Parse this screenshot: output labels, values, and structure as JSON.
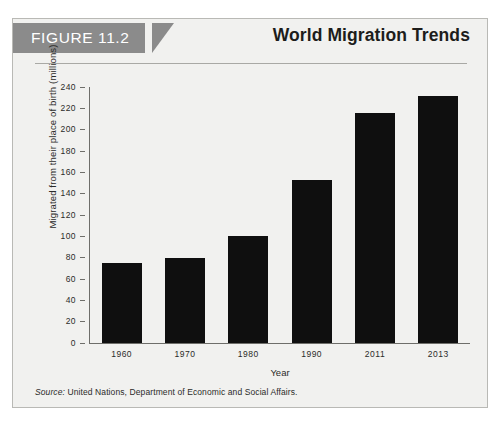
{
  "figure": {
    "tag": "FIGURE 11.2",
    "title": "World Migration Trends",
    "source_word": "Source:",
    "source_text": " United Nations, Department of Economic and Social Affairs.",
    "tag_bg_color": "#8b8b8b",
    "card_bg_color": "#f1f1ef",
    "bar_color": "#0f0f0f"
  },
  "chart_data": {
    "type": "bar",
    "title": "World Migration Trends",
    "xlabel": "Year",
    "ylabel": "Migrated from their place of birth (millions)",
    "categories": [
      "1960",
      "1970",
      "1980",
      "1990",
      "2011",
      "2013"
    ],
    "values": [
      75,
      80,
      100,
      153,
      216,
      232
    ],
    "ylim": [
      0,
      240
    ],
    "ytick_step": 20,
    "ytick_labels": [
      "240",
      "220",
      "200",
      "180",
      "160",
      "140",
      "120",
      "100",
      "80",
      "60",
      "40",
      "20",
      "0"
    ],
    "grid": false,
    "legend": null,
    "series": [
      {
        "name": "Migrated from their place of birth (millions)",
        "values": [
          75,
          80,
          100,
          153,
          216,
          232
        ]
      }
    ]
  }
}
